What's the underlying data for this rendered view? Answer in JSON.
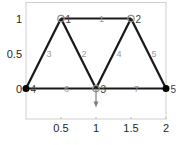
{
  "chart_data": {
    "type": "diagram",
    "title": "",
    "xlim": [
      0,
      2
    ],
    "ylim": [
      -0.44,
      1.23
    ],
    "xticks": [
      {
        "value": 0.5,
        "label": "0.5"
      },
      {
        "value": 1,
        "label": "1"
      },
      {
        "value": 1.5,
        "label": "1.5"
      },
      {
        "value": 2,
        "label": "2"
      }
    ],
    "yticks": [
      {
        "value": 0,
        "label": "0"
      },
      {
        "value": 0.5,
        "label": "0.5"
      },
      {
        "value": 1,
        "label": "1"
      }
    ],
    "grid": false,
    "nodes": [
      {
        "id": "1",
        "x": 0.5,
        "y": 1,
        "support": false
      },
      {
        "id": "2",
        "x": 1.5,
        "y": 1,
        "support": false
      },
      {
        "id": "3",
        "x": 1,
        "y": 0,
        "support": false
      },
      {
        "id": "4",
        "x": 0,
        "y": 0,
        "support": true
      },
      {
        "id": "5",
        "x": 2,
        "y": 0,
        "support": true
      }
    ],
    "elements": [
      {
        "id": "1",
        "from": "1",
        "to": "2"
      },
      {
        "id": "2",
        "from": "1",
        "to": "3"
      },
      {
        "id": "3",
        "from": "4",
        "to": "1"
      },
      {
        "id": "4",
        "from": "3",
        "to": "2"
      },
      {
        "id": "5",
        "from": "2",
        "to": "5"
      },
      {
        "id": "6",
        "from": "4",
        "to": "3"
      },
      {
        "id": "7",
        "from": "3",
        "to": "5"
      }
    ],
    "loads": [
      {
        "node": "3",
        "direction": "down"
      }
    ]
  },
  "colors": {
    "member": "#1a1a1a",
    "support_node": "#000000",
    "free_node": "#8c8c8c",
    "element_label": "#9a9a9a",
    "load_arrow": "#7f7f7f",
    "axes": "#c8c8c8"
  }
}
